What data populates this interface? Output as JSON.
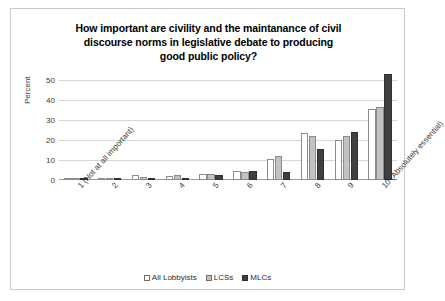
{
  "chart_data": {
    "type": "bar",
    "title": "How important are civility and the maintanance of civil discourse norms in legislative debate to producing good public policy?",
    "title_lines": [
      "How important are civility and the maintanance of civil",
      "discourse norms in legislative debate to producing",
      "good public policy?"
    ],
    "xlabel": "",
    "ylabel": "Percent",
    "ylim": [
      0,
      50
    ],
    "yticks": [
      0,
      10,
      20,
      30,
      40,
      50
    ],
    "grid": true,
    "legend_position": "bottom",
    "categories": [
      "1 (Not at all important)",
      "2",
      "3",
      "4",
      "5",
      "6",
      "7",
      "8",
      "9",
      "10 (Absolutely essential)"
    ],
    "series": [
      {
        "name": "All Lobbyists",
        "color": "#ffffff",
        "values": [
          0.6,
          0.8,
          2.4,
          2.0,
          3.0,
          4.6,
          10.6,
          23.5,
          20.0,
          35.5
        ]
      },
      {
        "name": "LCSs",
        "color": "#c2c2c2",
        "values": [
          0.5,
          1.2,
          1.6,
          2.6,
          3.2,
          4.0,
          12.0,
          21.8,
          22.0,
          36.5
        ]
      },
      {
        "name": "MLCs",
        "color": "#404040",
        "values": [
          0.4,
          0.5,
          0.8,
          0.6,
          2.6,
          4.4,
          4.0,
          15.5,
          24.0,
          53.0
        ]
      }
    ]
  },
  "legend": {
    "items": [
      {
        "label": "All Lobbyists"
      },
      {
        "label": "LCSs"
      },
      {
        "label": "MLCs"
      }
    ]
  }
}
